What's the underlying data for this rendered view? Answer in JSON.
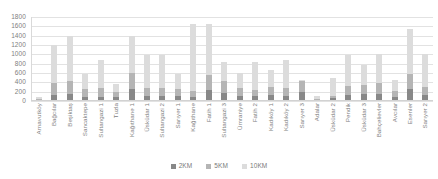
{
  "chart_data": {
    "type": "bar",
    "stacked": true,
    "title": "",
    "subtitle": "",
    "xlabel": "",
    "ylabel": "",
    "ylim": [
      0,
      1800
    ],
    "ytick_step": 200,
    "yticks": [
      1800,
      1600,
      1400,
      1200,
      1000,
      800,
      600,
      400,
      200,
      0
    ],
    "grid": true,
    "legend_position": "bottom",
    "categories": [
      "Arnavutköy",
      "Bağcılar",
      "Beşiktaş",
      "Sancaktepe",
      "Sultangazi 1",
      "Tuzla",
      "Kağıthane 1",
      "Üsküdar 1",
      "Sultangazi 2",
      "Sarıyer 1",
      "Kağıthane",
      "Fatih 1",
      "Sultangazi 3",
      "Ümraniye",
      "Fatih 2",
      "Kadıköy 1",
      "Kadıköy 2",
      "Sarıyer 3",
      "Adalar",
      "Üsküdar 2",
      "Pendik",
      "Üsküdar 3",
      "Bahçelievler",
      "Avcılar",
      "Esenler",
      "Sarıyer 2"
    ],
    "series": [
      {
        "name": "2KM",
        "color": "#888888",
        "values": [
          20,
          120,
          150,
          90,
          90,
          80,
          250,
          110,
          110,
          100,
          90,
          230,
          170,
          100,
          100,
          120,
          110,
          190,
          20,
          60,
          130,
          140,
          150,
          80,
          250,
          130
        ]
      },
      {
        "name": "5KM",
        "color": "#b5b5b5",
        "values": [
          20,
          260,
          280,
          160,
          180,
          110,
          350,
          170,
          170,
          150,
          120,
          330,
          260,
          170,
          140,
          180,
          170,
          230,
          20,
          50,
          200,
          210,
          230,
          140,
          320,
          180
        ]
      },
      {
        "name": "10KM",
        "color": "#dcdcdc",
        "values": [
          40,
          820,
          970,
          330,
          610,
          170,
          800,
          700,
          710,
          320,
          1440,
          1090,
          400,
          330,
          590,
          360,
          600,
          40,
          60,
          390,
          650,
          430,
          630,
          230,
          980,
          690
        ]
      }
    ],
    "legend": [
      "2KM",
      "5KM",
      "10KM"
    ]
  }
}
